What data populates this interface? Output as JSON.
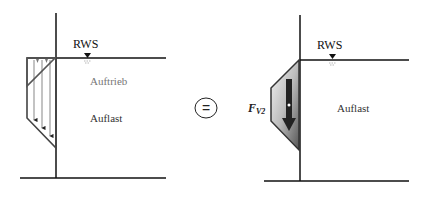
{
  "left_diagram": {
    "water_level_label": "RWS",
    "buoyancy_label": "Auftrieb",
    "load_label": "Auflast"
  },
  "equals_symbol": "=",
  "right_diagram": {
    "water_level_label": "RWS",
    "force_label": "F",
    "force_subscript": "V2",
    "load_label": "Auflast"
  },
  "colors": {
    "line": "#111111",
    "force_fill_light": "#f0f0f0",
    "force_fill_dark": "#555555",
    "buoyancy_text": "#777777"
  }
}
